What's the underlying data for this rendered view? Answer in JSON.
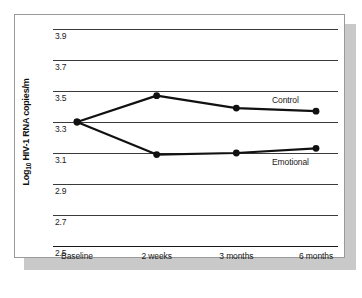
{
  "figure": {
    "yaxis_title_main": "HIV-1 RNA copies/m",
    "yaxis_title_prefix": "Log",
    "yaxis_title_sub": "10"
  },
  "chart_data": {
    "type": "line",
    "title": "",
    "xlabel": "",
    "ylabel": "Log10 HIV-1 RNA copies/m",
    "categories": [
      "Baseline",
      "2 weeks",
      "3 months",
      "6 months"
    ],
    "ylim": [
      2.5,
      3.9
    ],
    "yticks": [
      "3.9",
      "3.7",
      "3.5",
      "3.3",
      "3.1",
      "2.9",
      "2.7",
      "2.5"
    ],
    "ytick_values": [
      3.9,
      3.7,
      3.5,
      3.3,
      3.1,
      2.9,
      2.7,
      2.5
    ],
    "grid": true,
    "legend_position": "inline-right",
    "series": [
      {
        "name": "Control",
        "values": [
          3.3,
          3.47,
          3.39,
          3.37
        ],
        "color": "#111111"
      },
      {
        "name": "Emotional",
        "values": [
          3.3,
          3.09,
          3.1,
          3.13
        ],
        "color": "#111111"
      }
    ]
  }
}
